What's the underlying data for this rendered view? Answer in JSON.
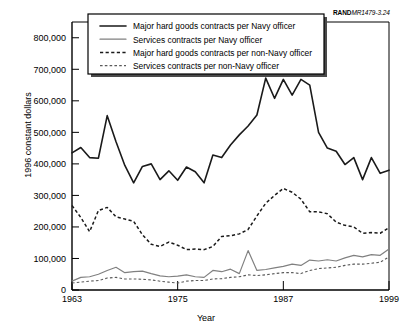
{
  "figure": {
    "source_prefix": "RAND",
    "source_code": "MR1479-3.24"
  },
  "chart_data": {
    "type": "line",
    "title": "",
    "xlabel": "Year",
    "ylabel": "1996 constant dollars",
    "xlim": [
      1963,
      1999
    ],
    "ylim": [
      0,
      850000
    ],
    "xticks": [
      1963,
      1975,
      1987,
      1999
    ],
    "xtick_labels": [
      "1963",
      "1975",
      "1987",
      "1999"
    ],
    "yticks": [
      0,
      100000,
      200000,
      300000,
      400000,
      500000,
      600000,
      700000,
      800000
    ],
    "ytick_labels": [
      "0",
      "100,000",
      "200,000",
      "300,000",
      "400,000",
      "500,000",
      "600,000",
      "700,000",
      "800,000"
    ],
    "grid": false,
    "legend_position": "top-center",
    "x": [
      1963,
      1964,
      1965,
      1966,
      1967,
      1968,
      1969,
      1970,
      1971,
      1972,
      1973,
      1974,
      1975,
      1976,
      1977,
      1978,
      1979,
      1980,
      1981,
      1982,
      1983,
      1984,
      1985,
      1986,
      1987,
      1988,
      1989,
      1990,
      1991,
      1992,
      1993,
      1994,
      1995,
      1996,
      1997,
      1998,
      1999
    ],
    "series": [
      {
        "name": "Major hard goods contracts per Navy officer",
        "style": "solid",
        "color": "#1a1a1a",
        "values": [
          435000,
          452000,
          420000,
          418000,
          553000,
          470000,
          395000,
          340000,
          392000,
          400000,
          350000,
          378000,
          348000,
          390000,
          375000,
          340000,
          428000,
          420000,
          460000,
          492000,
          520000,
          555000,
          672000,
          608000,
          668000,
          618000,
          668000,
          650000,
          500000,
          450000,
          440000,
          398000,
          420000,
          350000,
          420000,
          370000,
          380000
        ]
      },
      {
        "name": "Services contracts per Navy officer",
        "style": "solid",
        "color": "#808080",
        "values": [
          28000,
          40000,
          42000,
          50000,
          62000,
          72000,
          55000,
          58000,
          60000,
          52000,
          45000,
          42000,
          44000,
          48000,
          42000,
          40000,
          62000,
          58000,
          66000,
          52000,
          125000,
          62000,
          65000,
          70000,
          75000,
          82000,
          78000,
          95000,
          92000,
          96000,
          92000,
          102000,
          110000,
          105000,
          112000,
          110000,
          130000
        ]
      },
      {
        "name": "Major hard goods contracts per non-Navy officer",
        "style": "dashed",
        "color": "#1a1a1a",
        "values": [
          268000,
          230000,
          185000,
          252000,
          262000,
          232000,
          225000,
          218000,
          175000,
          145000,
          138000,
          152000,
          142000,
          128000,
          130000,
          128000,
          138000,
          170000,
          172000,
          178000,
          192000,
          235000,
          275000,
          300000,
          322000,
          310000,
          288000,
          248000,
          248000,
          242000,
          215000,
          205000,
          200000,
          180000,
          182000,
          180000,
          198000
        ]
      },
      {
        "name": "Services contracts per non-Navy officer",
        "style": "dashed",
        "color": "#5a5a5a",
        "values": [
          22000,
          25000,
          28000,
          30000,
          38000,
          40000,
          35000,
          35000,
          34000,
          32000,
          28000,
          25000,
          22000,
          28000,
          30000,
          30000,
          35000,
          36000,
          40000,
          42000,
          48000,
          46000,
          48000,
          52000,
          55000,
          55000,
          52000,
          62000,
          68000,
          70000,
          72000,
          78000,
          82000,
          82000,
          85000,
          88000,
          105000
        ]
      }
    ]
  },
  "legend": {
    "items": [
      {
        "label": "Major hard goods contracts per Navy officer",
        "style": "solid-black"
      },
      {
        "label": "Services contracts per Navy officer",
        "style": "solid-gray"
      },
      {
        "label": "Major hard goods contracts per non-Navy officer",
        "style": "dashed-black"
      },
      {
        "label": "Services contracts per non-Navy officer",
        "style": "dashed-gray"
      }
    ]
  }
}
